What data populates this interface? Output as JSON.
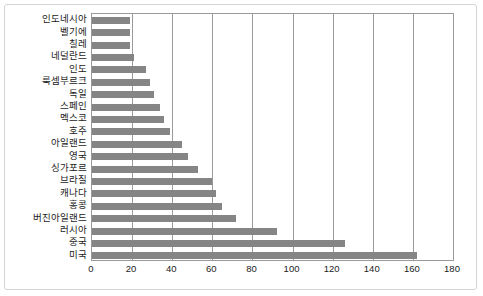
{
  "chart_data": {
    "type": "bar",
    "orientation": "horizontal",
    "title": "",
    "xlabel": "",
    "ylabel": "",
    "xlim": [
      0,
      180
    ],
    "xticks": [
      0,
      20,
      40,
      60,
      80,
      100,
      120,
      140,
      160,
      180
    ],
    "grid": true,
    "legend": null,
    "bar_color": "#858585",
    "frame_color": "#9a9a9a",
    "categories": [
      "인도네시아",
      "벨기에",
      "칠레",
      "네덜란드",
      "인도",
      "룩셈부르크",
      "독일",
      "스페인",
      "멕스코",
      "호주",
      "아일랜드",
      "영국",
      "싱가포르",
      "브라질",
      "캐나다",
      "홍콩",
      "버진아일랜드",
      "러시아",
      "중국",
      "미국"
    ],
    "values": [
      19,
      19,
      19,
      21,
      27,
      29,
      31,
      34,
      36,
      39,
      45,
      48,
      53,
      60,
      62,
      65,
      72,
      92,
      126,
      162
    ]
  }
}
